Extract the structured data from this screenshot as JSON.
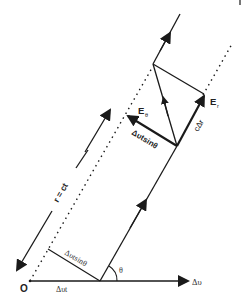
{
  "diagram": {
    "labels": {
      "origin": "O",
      "delta_v": "Δυ",
      "delta_vt": "Δυt",
      "theta": "θ",
      "delta_vt_sin_theta_bottom": "Δυtsinθ",
      "delta_vt_sin_theta_top": "Δυtsinθ",
      "r_eq_ct": "r = ct",
      "c_delta_r": "cΔr",
      "E_theta_main": "E",
      "E_theta_sub": "θ",
      "E_r_main": "E",
      "E_r_sub": "r"
    },
    "colors": {
      "stroke": "#1a1a1a",
      "text": "#222222",
      "background": "#ffffff"
    }
  }
}
